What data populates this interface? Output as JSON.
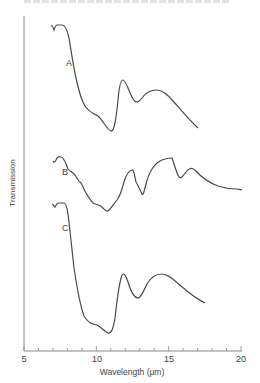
{
  "chart_data": {
    "type": "line",
    "title": "",
    "xlabel": "Wavelength (μm)",
    "ylabel": "Transmission",
    "xlim": [
      5,
      20
    ],
    "x_ticks": [
      5,
      10,
      15,
      20
    ],
    "x_tick_labels": [
      "5",
      "10",
      "15",
      "20"
    ],
    "x_minor_tick_step": 1,
    "grid": false,
    "legend": "inline curve labels",
    "y_units": "arbitrary (curves vertically offset)",
    "series": [
      {
        "name": "A",
        "x": [
          6.2,
          6.4,
          6.6,
          6.8,
          7.0,
          7.4,
          7.8,
          8.2,
          8.6,
          9.0,
          9.6,
          10.2,
          10.8,
          11.1,
          11.4,
          11.7,
          12.0,
          12.3,
          12.8,
          13.3,
          14.0,
          14.7,
          15.5,
          16.4,
          17.2
        ],
        "y": [
          0.97,
          0.96,
          0.97,
          0.95,
          0.97,
          0.97,
          0.92,
          0.7,
          0.45,
          0.3,
          0.22,
          0.2,
          0.14,
          0.12,
          0.18,
          0.4,
          0.52,
          0.46,
          0.36,
          0.38,
          0.45,
          0.43,
          0.33,
          0.22,
          0.16
        ]
      },
      {
        "name": "B",
        "x": [
          6.2,
          6.5,
          6.9,
          7.3,
          7.8,
          8.2,
          8.8,
          9.4,
          10.0,
          10.5,
          11.0,
          11.5,
          12.0,
          12.3,
          12.6,
          12.9,
          13.2,
          13.6,
          14.2,
          14.9,
          15.4,
          16.0,
          16.7,
          17.4,
          18.4,
          19.3,
          20.0
        ],
        "y": [
          0.86,
          0.84,
          0.87,
          0.86,
          0.8,
          0.74,
          0.68,
          0.61,
          0.58,
          0.52,
          0.56,
          0.62,
          0.74,
          0.76,
          0.66,
          0.5,
          0.6,
          0.78,
          0.86,
          0.88,
          0.84,
          0.71,
          0.78,
          0.7,
          0.64,
          0.62,
          0.58
        ]
      },
      {
        "name": "C",
        "x": [
          6.2,
          6.5,
          6.8,
          7.1,
          7.5,
          7.9,
          8.4,
          8.9,
          9.4,
          9.9,
          10.4,
          11.0,
          11.3,
          11.7,
          12.0,
          12.4,
          12.9,
          13.4,
          14.0,
          14.8,
          15.6,
          16.5,
          17.4
        ],
        "y": [
          0.97,
          0.96,
          0.97,
          0.96,
          0.97,
          0.9,
          0.6,
          0.3,
          0.15,
          0.09,
          0.08,
          0.05,
          0.14,
          0.48,
          0.53,
          0.42,
          0.36,
          0.44,
          0.52,
          0.51,
          0.43,
          0.33,
          0.26
        ]
      }
    ],
    "annotations": [
      {
        "text": "A",
        "x": 7.6,
        "near_series": "A"
      },
      {
        "text": "B",
        "x": 7.0,
        "near_series": "B"
      },
      {
        "text": "C",
        "x": 7.1,
        "near_series": "C"
      }
    ]
  },
  "axes": {
    "xlabel": "Wavelength (μm)",
    "ylabel": "Transmission",
    "tick_labels": [
      "5",
      "10",
      "15",
      "20"
    ]
  },
  "labels": {
    "a": "A",
    "b": "B",
    "c": "C"
  },
  "colors": {
    "line": "#4a4a4a",
    "axis": "#8a8a8a",
    "text": "#444444"
  }
}
